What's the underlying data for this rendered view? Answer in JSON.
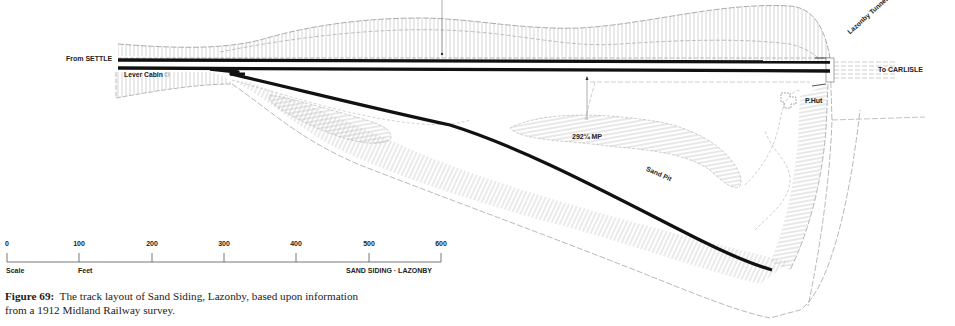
{
  "labels": {
    "from": "From SETTLE",
    "to": "To CARLISLE",
    "lever_cabin": "Lever Cabin",
    "tunnel": "Lazonby Tunnel (No 306)",
    "p_hut": "P.Hut",
    "milepost": "292¼ MP",
    "sand_pit": "Sand Pit"
  },
  "scale": {
    "ticks": [
      "0",
      "100",
      "200",
      "300",
      "400",
      "500",
      "600"
    ],
    "left_label": "Scale",
    "unit_label": "Feet",
    "title": "SAND SIDING · LAZONBY"
  },
  "caption": {
    "figure": "Figure 69:",
    "text": "The track layout of Sand Siding, Lazonby, based upon information from a 1912 Midland Railway survey."
  },
  "colors": {
    "track": "#111111",
    "linework": "#8a8a8a",
    "hatch": "#b5b5b5"
  }
}
